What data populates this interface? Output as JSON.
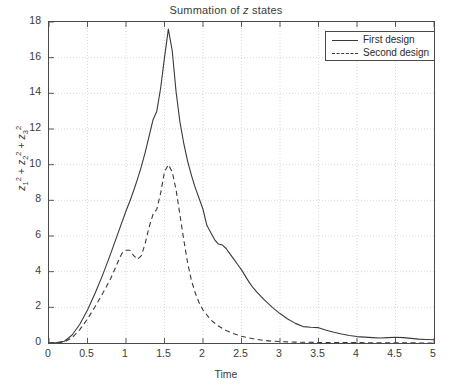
{
  "chart_data": {
    "type": "line",
    "title": "Summation of z states",
    "title_prefix": "Summation of ",
    "title_italic": "z",
    "title_suffix": " states",
    "xlabel": "Time",
    "ylabel": "z_1^2 + z_2^2 + z_3^2",
    "xlim": [
      0,
      5
    ],
    "ylim": [
      0,
      18
    ],
    "xticks": [
      "0",
      "0.5",
      "1",
      "1.5",
      "2",
      "2.5",
      "3",
      "3.5",
      "4",
      "4.5",
      "5"
    ],
    "xtick_values": [
      0,
      0.5,
      1,
      1.5,
      2,
      2.5,
      3,
      3.5,
      4,
      4.5,
      5
    ],
    "yticks": [
      "0",
      "2",
      "4",
      "6",
      "8",
      "10",
      "12",
      "14",
      "16",
      "18"
    ],
    "ytick_values": [
      0,
      2,
      4,
      6,
      8,
      10,
      12,
      14,
      16,
      18
    ],
    "grid": true,
    "grid_style": "dotted",
    "legend_position": "top-right",
    "line_color": "#3a3a3a",
    "grid_color": "#c8c8c8",
    "axis_color": "#4a4a4a",
    "series": [
      {
        "name": "First design",
        "style": "solid",
        "x": [
          0.0,
          0.1,
          0.2,
          0.3,
          0.4,
          0.5,
          0.6,
          0.7,
          0.8,
          0.9,
          1.0,
          1.05,
          1.1,
          1.15,
          1.2,
          1.25,
          1.3,
          1.35,
          1.4,
          1.45,
          1.5,
          1.55,
          1.6,
          1.65,
          1.7,
          1.75,
          1.8,
          1.85,
          1.9,
          1.95,
          2.0,
          2.05,
          2.1,
          2.15,
          2.2,
          2.25,
          2.3,
          2.35,
          2.4,
          2.45,
          2.5,
          2.55,
          2.6,
          2.65,
          2.7,
          2.8,
          2.9,
          3.0,
          3.1,
          3.2,
          3.3,
          3.4,
          3.5,
          3.6,
          3.7,
          3.8,
          3.9,
          4.0,
          4.1,
          4.2,
          4.3,
          4.4,
          4.5,
          4.6,
          4.7,
          4.8,
          4.9,
          5.0
        ],
        "y": [
          0.0,
          0.02,
          0.1,
          0.45,
          1.05,
          1.85,
          2.8,
          3.85,
          5.0,
          6.2,
          7.4,
          7.95,
          8.55,
          9.2,
          9.9,
          10.7,
          11.6,
          12.5,
          13.0,
          14.3,
          16.0,
          17.6,
          16.4,
          14.1,
          12.4,
          11.2,
          10.2,
          9.4,
          8.7,
          8.1,
          7.5,
          6.6,
          6.2,
          5.8,
          5.55,
          5.5,
          5.3,
          5.0,
          4.7,
          4.4,
          4.1,
          3.75,
          3.4,
          3.1,
          2.85,
          2.4,
          2.0,
          1.65,
          1.35,
          1.1,
          0.92,
          0.88,
          0.86,
          0.72,
          0.6,
          0.5,
          0.42,
          0.36,
          0.33,
          0.3,
          0.28,
          0.3,
          0.32,
          0.3,
          0.26,
          0.22,
          0.2,
          0.18
        ],
        "peak": 17.6,
        "peak_x": 1.55
      },
      {
        "name": "Second design",
        "style": "dashed",
        "x": [
          0.0,
          0.1,
          0.2,
          0.3,
          0.4,
          0.5,
          0.6,
          0.7,
          0.8,
          0.9,
          0.95,
          1.0,
          1.05,
          1.1,
          1.15,
          1.2,
          1.25,
          1.3,
          1.35,
          1.4,
          1.45,
          1.5,
          1.55,
          1.6,
          1.65,
          1.7,
          1.75,
          1.8,
          1.85,
          1.9,
          1.95,
          2.0,
          2.1,
          2.2,
          2.3,
          2.4,
          2.5,
          2.6,
          2.7,
          2.8,
          2.9,
          3.0,
          3.2,
          3.5,
          4.0,
          4.5,
          5.0
        ],
        "y": [
          0.0,
          0.01,
          0.06,
          0.3,
          0.75,
          1.35,
          2.05,
          2.8,
          3.6,
          4.6,
          5.05,
          5.2,
          5.2,
          4.9,
          4.7,
          4.9,
          5.6,
          6.5,
          7.2,
          7.5,
          8.4,
          9.6,
          10.0,
          9.6,
          8.6,
          7.2,
          5.8,
          4.5,
          3.5,
          2.8,
          2.25,
          1.85,
          1.3,
          0.95,
          0.7,
          0.52,
          0.38,
          0.28,
          0.2,
          0.14,
          0.1,
          0.08,
          0.05,
          0.03,
          0.02,
          0.01,
          0.0
        ],
        "peak": 10.0,
        "peak_x": 1.5,
        "local_max": 5.2,
        "local_max_x": 1.02
      }
    ]
  },
  "legend": {
    "items": [
      {
        "label": "First design",
        "style": "solid"
      },
      {
        "label": "Second design",
        "style": "dashed"
      }
    ]
  }
}
